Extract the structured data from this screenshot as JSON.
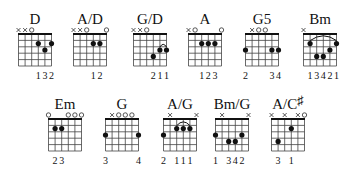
{
  "colors": {
    "ink": "#111111",
    "grid": "#444444",
    "background": "#ffffff"
  },
  "grid": {
    "strings": 6,
    "frets": 5
  },
  "chords": [
    {
      "name": "D",
      "row": 0,
      "cx": 35,
      "markers": [
        "x",
        "x",
        "o",
        "",
        "",
        ""
      ],
      "dots": [
        [
          4,
          2
        ],
        [
          5,
          3
        ],
        [
          6,
          2
        ]
      ],
      "barre": null,
      "fingers": [
        "",
        "",
        "",
        "1",
        "3",
        "2"
      ]
    },
    {
      "name": "A/D",
      "row": 0,
      "cx": 90,
      "markers": [
        "x",
        "x",
        "o",
        "",
        "",
        "o"
      ],
      "dots": [
        [
          4,
          2
        ],
        [
          5,
          2
        ]
      ],
      "barre": null,
      "fingers": [
        "",
        "",
        "",
        "1",
        "2",
        ""
      ]
    },
    {
      "name": "G/D",
      "row": 0,
      "cx": 150,
      "markers": [
        "x",
        "x",
        "o",
        "",
        "",
        ""
      ],
      "dots": [
        [
          4,
          4
        ],
        [
          5,
          3
        ],
        [
          6,
          3
        ]
      ],
      "barre": [
        5,
        6,
        3
      ],
      "fingers": [
        "",
        "",
        "",
        "2",
        "1",
        "1"
      ]
    },
    {
      "name": "A",
      "row": 0,
      "cx": 205,
      "markers": [
        "x",
        "o",
        "",
        "",
        "",
        "o"
      ],
      "dots": [
        [
          3,
          2
        ],
        [
          4,
          2
        ],
        [
          5,
          2
        ]
      ],
      "barre": null,
      "fingers": [
        "",
        "",
        "1",
        "2",
        "3",
        ""
      ]
    },
    {
      "name": "G5",
      "row": 0,
      "cx": 262,
      "markers": [
        "",
        "x",
        "o",
        "o",
        "",
        ""
      ],
      "dots": [
        [
          1,
          3
        ],
        [
          5,
          3
        ],
        [
          6,
          3
        ]
      ],
      "barre": null,
      "fingers": [
        "2",
        "",
        "",
        "",
        "3",
        "4"
      ]
    },
    {
      "name": "Bm",
      "row": 0,
      "cx": 320,
      "markers": [
        "x",
        "",
        "",
        "",
        "",
        ""
      ],
      "dots": [
        [
          2,
          2
        ],
        [
          3,
          4
        ],
        [
          4,
          4
        ],
        [
          5,
          3
        ],
        [
          6,
          2
        ]
      ],
      "barre": [
        2,
        6,
        2
      ],
      "fingers": [
        "",
        "1",
        "3",
        "4",
        "2",
        "1"
      ]
    },
    {
      "name": "Em",
      "row": 1,
      "cx": 65,
      "markers": [
        "o",
        "",
        "",
        "o",
        "o",
        "o"
      ],
      "dots": [
        [
          2,
          2
        ],
        [
          3,
          2
        ]
      ],
      "barre": null,
      "fingers": [
        "",
        "2",
        "3",
        "",
        "",
        ""
      ]
    },
    {
      "name": "G",
      "row": 1,
      "cx": 122,
      "markers": [
        "",
        "x",
        "o",
        "o",
        "o",
        ""
      ],
      "dots": [
        [
          1,
          3
        ],
        [
          6,
          3
        ]
      ],
      "barre": null,
      "fingers": [
        "3",
        "",
        "",
        "",
        "",
        "4"
      ]
    },
    {
      "name": "A/G",
      "row": 1,
      "cx": 180,
      "markers": [
        "",
        "x",
        "",
        "",
        "",
        "x"
      ],
      "dots": [
        [
          1,
          3
        ],
        [
          3,
          2
        ],
        [
          4,
          2
        ],
        [
          5,
          2
        ]
      ],
      "barre": [
        3,
        5,
        2
      ],
      "fingers": [
        "2",
        "",
        "1",
        "1",
        "1",
        ""
      ]
    },
    {
      "name": "Bm/G",
      "row": 1,
      "cx": 232,
      "markers": [
        "",
        "x",
        "",
        "",
        "",
        "x"
      ],
      "dots": [
        [
          1,
          3
        ],
        [
          3,
          4
        ],
        [
          4,
          4
        ],
        [
          5,
          3
        ]
      ],
      "barre": null,
      "fingers": [
        "1",
        "",
        "3",
        "4",
        "2",
        ""
      ]
    },
    {
      "name": "A/C#",
      "row": 1,
      "cx": 288,
      "markers": [
        "x",
        "",
        "x",
        "",
        "x",
        "o"
      ],
      "dots": [
        [
          2,
          4
        ],
        [
          4,
          2
        ]
      ],
      "barre": null,
      "fingers": [
        "",
        "3",
        "",
        "1",
        "",
        ""
      ]
    }
  ]
}
